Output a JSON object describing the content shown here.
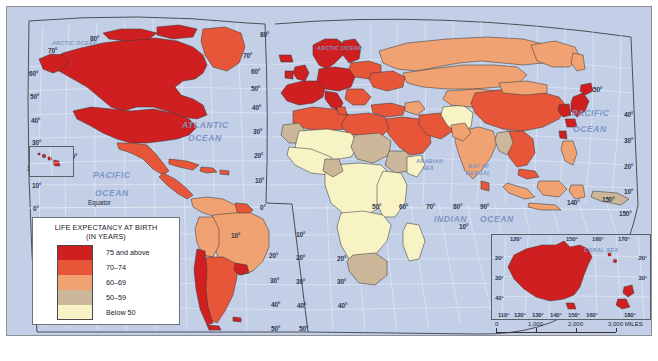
{
  "map": {
    "title": "Life Expectancy at Birth",
    "projection_note": "MODIFIED GOODE'S HOMOLOSINE EQUAL-AREA PROJECTION",
    "legend": {
      "title_line1": "LIFE EXPECTANCY AT BIRTH",
      "title_line2": "(IN YEARS)",
      "classes": [
        {
          "label": "75 and above",
          "color": "#cf1f20"
        },
        {
          "label": "70–74",
          "color": "#e8563a"
        },
        {
          "label": "60–69",
          "color": "#f0a272"
        },
        {
          "label": "50–59",
          "color": "#cdb79a"
        },
        {
          "label": "Below 50",
          "color": "#f7f3c4"
        }
      ]
    },
    "ocean_labels": [
      {
        "text": "ARCTIC OCEAN",
        "x": 45,
        "y": 33,
        "size": "small"
      },
      {
        "text": "ARCTIC OCEAN",
        "x": 310,
        "y": 38,
        "size": "small"
      },
      {
        "text": "ATLANTIC",
        "x": 175,
        "y": 113,
        "size": "normal"
      },
      {
        "text": "OCEAN",
        "x": 181,
        "y": 126,
        "size": "normal"
      },
      {
        "text": "PACIFIC",
        "x": 565,
        "y": 101,
        "size": "normal"
      },
      {
        "text": "OCEAN",
        "x": 566,
        "y": 117,
        "size": "normal"
      },
      {
        "text": "PACIFIC",
        "x": 86,
        "y": 163,
        "size": "normal"
      },
      {
        "text": "OCEAN",
        "x": 88,
        "y": 181,
        "size": "normal"
      },
      {
        "text": "INDIAN",
        "x": 427,
        "y": 207,
        "size": "normal"
      },
      {
        "text": "OCEAN",
        "x": 473,
        "y": 207,
        "size": "normal"
      },
      {
        "text": "ARABIAN",
        "x": 409,
        "y": 151,
        "size": "small"
      },
      {
        "text": "SEA",
        "x": 415,
        "y": 158,
        "size": "small"
      },
      {
        "text": "BAY OF",
        "x": 461,
        "y": 156,
        "size": "small"
      },
      {
        "text": "BENGAL",
        "x": 459,
        "y": 163,
        "size": "small"
      },
      {
        "text": "CORAL SEA",
        "x": 578,
        "y": 240,
        "size": "small"
      }
    ],
    "plain_labels": [
      {
        "text": "Equator",
        "x": 81,
        "y": 192
      }
    ],
    "lat_labels_left": [
      "60°",
      "50°",
      "40°",
      "30°",
      "10°",
      "0°"
    ],
    "lon_labels_top": [
      "80°",
      "70°"
    ],
    "graticule_labels": [
      {
        "text": "80°",
        "x": 83,
        "y": 28
      },
      {
        "text": "70°",
        "x": 41,
        "y": 40
      },
      {
        "text": "60°",
        "x": 22,
        "y": 63
      },
      {
        "text": "50°",
        "x": 23,
        "y": 86
      },
      {
        "text": "40°",
        "x": 24,
        "y": 110
      },
      {
        "text": "30°",
        "x": 25,
        "y": 132
      },
      {
        "text": "160°",
        "x": 20,
        "y": 158
      },
      {
        "text": "20°",
        "x": 61,
        "y": 146
      },
      {
        "text": "10°",
        "x": 25,
        "y": 175
      },
      {
        "text": "0°",
        "x": 26,
        "y": 198
      },
      {
        "text": "10°",
        "x": 26,
        "y": 222
      },
      {
        "text": "20°",
        "x": 26,
        "y": 247
      },
      {
        "text": "30°",
        "x": 27,
        "y": 272
      },
      {
        "text": "40°",
        "x": 28,
        "y": 296
      },
      {
        "text": "80°",
        "x": 253,
        "y": 24
      },
      {
        "text": "70°",
        "x": 236,
        "y": 45
      },
      {
        "text": "60°",
        "x": 244,
        "y": 61
      },
      {
        "text": "50°",
        "x": 244,
        "y": 78
      },
      {
        "text": "40°",
        "x": 245,
        "y": 97
      },
      {
        "text": "30°",
        "x": 246,
        "y": 121
      },
      {
        "text": "20°",
        "x": 247,
        "y": 145
      },
      {
        "text": "10°",
        "x": 248,
        "y": 170
      },
      {
        "text": "0°",
        "x": 253,
        "y": 197
      },
      {
        "text": "10°",
        "x": 224,
        "y": 225
      },
      {
        "text": "20°",
        "x": 262,
        "y": 245
      },
      {
        "text": "30°",
        "x": 263,
        "y": 270
      },
      {
        "text": "40°",
        "x": 264,
        "y": 294
      },
      {
        "text": "50°",
        "x": 264,
        "y": 318
      },
      {
        "text": "10°",
        "x": 289,
        "y": 224
      },
      {
        "text": "20°",
        "x": 289,
        "y": 247
      },
      {
        "text": "30°",
        "x": 289,
        "y": 271
      },
      {
        "text": "40°",
        "x": 290,
        "y": 295
      },
      {
        "text": "50°",
        "x": 292,
        "y": 318
      },
      {
        "text": "20°",
        "x": 330,
        "y": 248
      },
      {
        "text": "30°",
        "x": 330,
        "y": 271
      },
      {
        "text": "40°",
        "x": 331,
        "y": 295
      },
      {
        "text": "50°",
        "x": 365,
        "y": 196
      },
      {
        "text": "60°",
        "x": 392,
        "y": 196
      },
      {
        "text": "70°",
        "x": 419,
        "y": 196
      },
      {
        "text": "80°",
        "x": 446,
        "y": 196
      },
      {
        "text": "90°",
        "x": 473,
        "y": 196
      },
      {
        "text": "10°",
        "x": 452,
        "y": 216
      },
      {
        "text": "40°",
        "x": 617,
        "y": 104
      },
      {
        "text": "30°",
        "x": 617,
        "y": 130
      },
      {
        "text": "20°",
        "x": 617,
        "y": 156
      },
      {
        "text": "10°",
        "x": 617,
        "y": 181
      },
      {
        "text": "150°",
        "x": 612,
        "y": 203
      },
      {
        "text": "140°",
        "x": 560,
        "y": 192
      },
      {
        "text": "150°",
        "x": 595,
        "y": 189
      },
      {
        "text": "50°",
        "x": 586,
        "y": 79
      },
      {
        "text": "170°",
        "x": 617,
        "y": 230
      }
    ]
  },
  "australia_inset": {
    "label_coral_sea": "CORAL SEA",
    "lat_labels": [
      "20°",
      "30°",
      "40°"
    ],
    "lat_labels_right": [
      "20°",
      "30°"
    ],
    "lon_labels_top": [
      "120°",
      "150°",
      "160°",
      "170°"
    ],
    "lon_labels_bottom": [
      "110°",
      "120°",
      "130°",
      "140°",
      "150°",
      "160°",
      "180°"
    ]
  },
  "scale": {
    "miles": {
      "ticks": [
        "0",
        "1,000",
        "2,000",
        "3,000"
      ],
      "unit": "MILES"
    },
    "kilometers": {
      "ticks": [
        "0",
        "1,000",
        "2,000",
        "3,000"
      ],
      "unit": "KILOMETERS"
    }
  },
  "chart_data": {
    "type": "map",
    "title": "Life Expectancy at Birth (in years)",
    "projection": "Modified Goode's Homolosine Equal-Area Projection",
    "classes": [
      {
        "range": "75 and above",
        "color": "#cf1f20"
      },
      {
        "range": "70-74",
        "color": "#e8563a"
      },
      {
        "range": "60-69",
        "color": "#f0a272"
      },
      {
        "range": "50-59",
        "color": "#cdb79a"
      },
      {
        "range": "Below 50",
        "color": "#f7f3c4"
      }
    ],
    "regions": [
      {
        "name": "Canada",
        "class": "75 and above"
      },
      {
        "name": "United States",
        "class": "75 and above"
      },
      {
        "name": "Greenland",
        "class": "70-74"
      },
      {
        "name": "Mexico",
        "class": "70-74"
      },
      {
        "name": "Central America",
        "class": "70-74"
      },
      {
        "name": "Caribbean",
        "class": "70-74"
      },
      {
        "name": "Brazil",
        "class": "60-69"
      },
      {
        "name": "Argentina",
        "class": "70-74"
      },
      {
        "name": "Chile",
        "class": "75 and above"
      },
      {
        "name": "Uruguay",
        "class": "75 and above"
      },
      {
        "name": "Western Europe",
        "class": "75 and above"
      },
      {
        "name": "Scandinavia",
        "class": "75 and above"
      },
      {
        "name": "Eastern Europe",
        "class": "70-74"
      },
      {
        "name": "Russia",
        "class": "60-69"
      },
      {
        "name": "North Africa",
        "class": "60-69"
      },
      {
        "name": "Sub-Saharan Africa",
        "class": "Below 50"
      },
      {
        "name": "Southern Africa",
        "class": "50-59"
      },
      {
        "name": "Middle East",
        "class": "70-74"
      },
      {
        "name": "India",
        "class": "60-69"
      },
      {
        "name": "China",
        "class": "70-74"
      },
      {
        "name": "Japan",
        "class": "75 and above"
      },
      {
        "name": "Southeast Asia",
        "class": "60-69"
      },
      {
        "name": "Australia",
        "class": "75 and above"
      },
      {
        "name": "New Zealand",
        "class": "75 and above"
      },
      {
        "name": "Afghanistan",
        "class": "Below 50"
      }
    ]
  }
}
